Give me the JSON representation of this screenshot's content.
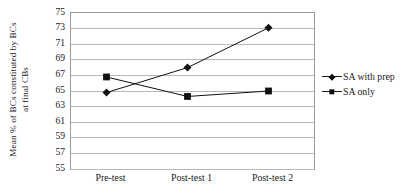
{
  "chart_data": {
    "type": "line",
    "title": "",
    "xlabel": "",
    "ylabel": "Mean % of BCs constituted by BCs at final CBs",
    "ylabel_line1": "Mean % of BCs constituted by BCs",
    "ylabel_line2": "at final CBs",
    "categories": [
      "Pre-test",
      "Post-test 1",
      "Post-test 2"
    ],
    "ylim": [
      55,
      75
    ],
    "ytick_step": 2,
    "yticks": [
      75,
      73,
      71,
      69,
      67,
      65,
      63,
      61,
      59,
      57,
      55
    ],
    "ytick_labels": [
      "75",
      "73",
      "71",
      "69",
      "67",
      "65",
      "63",
      "61",
      "59",
      "57",
      "55"
    ],
    "grid": "horizontal",
    "legend_position": "right",
    "series": [
      {
        "name": "SA with prep",
        "marker": "diamond",
        "color": "#111111",
        "values": [
          64.8,
          68.0,
          73.1
        ]
      },
      {
        "name": "SA only",
        "marker": "square",
        "color": "#111111",
        "values": [
          66.8,
          64.3,
          65.0
        ]
      }
    ]
  },
  "legend": {
    "items": [
      {
        "label": "SA with prep",
        "marker": "diamond"
      },
      {
        "label": "SA only",
        "marker": "square"
      }
    ]
  },
  "colors": {
    "line": "#111111",
    "gridline": "#b9b9b9",
    "plot_border": "#9a9a9a",
    "text": "#1a1a1a",
    "background": "#ffffff"
  }
}
